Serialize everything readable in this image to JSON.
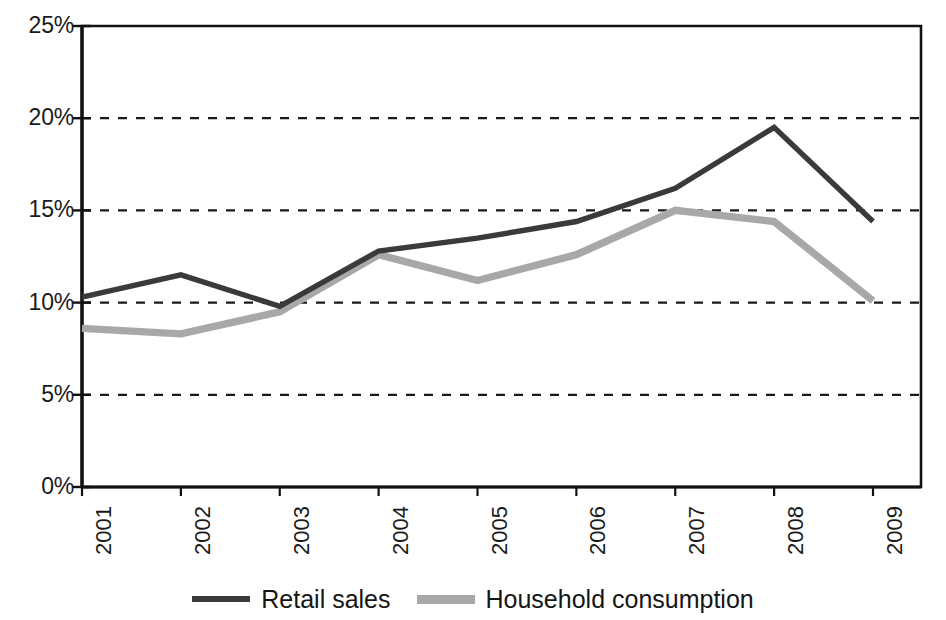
{
  "chart_data": {
    "type": "line",
    "title": "",
    "subtitle": "",
    "xlabel": "",
    "ylabel": "",
    "categories": [
      "2001",
      "2002",
      "2003",
      "2004",
      "2005",
      "2006",
      "2007",
      "2008",
      "2009"
    ],
    "series": [
      {
        "name": "Retail sales",
        "color": "#3a3a3a",
        "values": [
          10.3,
          11.5,
          9.8,
          12.8,
          13.5,
          14.4,
          16.2,
          19.5,
          14.4
        ]
      },
      {
        "name": "Household consumption",
        "color": "#a8a8a8",
        "values": [
          8.6,
          8.3,
          9.5,
          12.6,
          11.2,
          12.6,
          15.0,
          14.4,
          10.1
        ]
      }
    ],
    "ylim": [
      0,
      25
    ],
    "yticks": [
      0,
      5,
      10,
      15,
      20,
      25
    ],
    "ytick_labels": [
      "0%",
      "5%",
      "10%",
      "15%",
      "20%",
      "25%"
    ],
    "value_suffix": "%",
    "grid": {
      "horizontal": true,
      "vertical": false,
      "style": "dashed",
      "color": "#1a1a1a"
    },
    "legend": {
      "position": "bottom",
      "entries": [
        {
          "label": "Retail sales",
          "color": "#3a3a3a"
        },
        {
          "label": "Household consumption",
          "color": "#a8a8a8"
        }
      ]
    },
    "axis": {
      "line_color": "#111111",
      "border": true
    },
    "plot_area": {
      "x0": 82,
      "y0": 26,
      "x1": 921,
      "y1": 487
    }
  }
}
